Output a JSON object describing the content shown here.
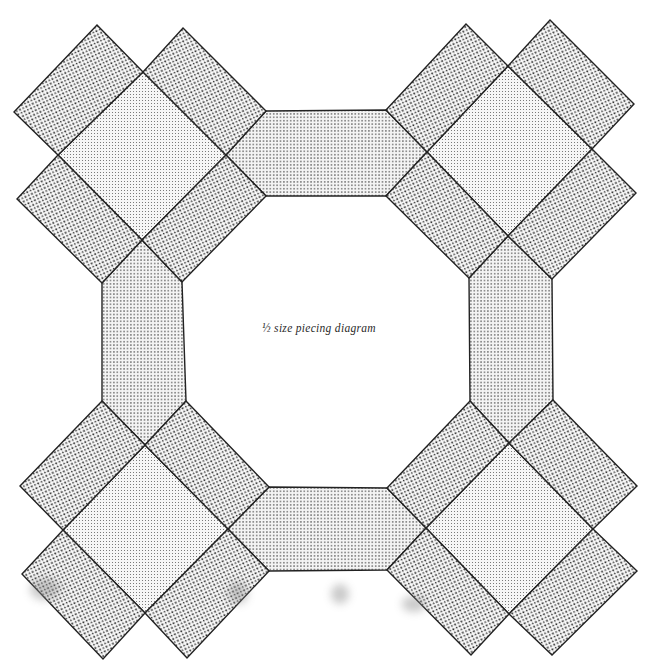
{
  "figure": {
    "caption": "½ size piecing diagram",
    "top_cutoff_text": "",
    "stroke_color": "#222222",
    "background": "#ffffff",
    "fills": {
      "rectangle_pattern": "coarse dark dot stipple",
      "square_pattern": "fine light dot grid",
      "hexagon_pattern": "fine medium dot grid"
    }
  },
  "pieces": {
    "corner_clusters": [
      {
        "name": "top-left",
        "square": "center diamond",
        "rectangles": 4
      },
      {
        "name": "top-right",
        "square": "center diamond",
        "rectangles": 4
      },
      {
        "name": "bottom-left",
        "square": "center diamond",
        "rectangles": 4
      },
      {
        "name": "bottom-right",
        "square": "center diamond",
        "rectangles": 4
      }
    ],
    "hexagons": [
      "top",
      "left",
      "right",
      "bottom"
    ],
    "counts": {
      "squares": 4,
      "rectangles": 16,
      "hexagons": 4
    }
  }
}
